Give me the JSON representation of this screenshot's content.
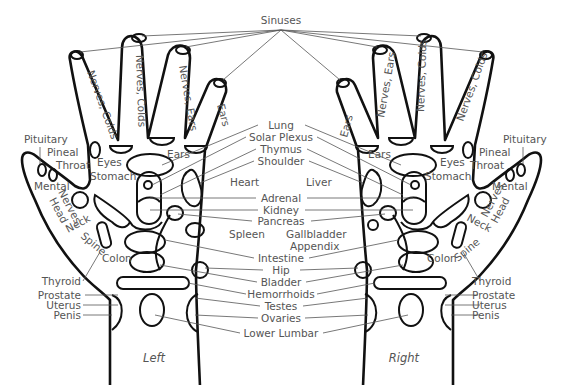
{
  "captions": {
    "left": "Left",
    "right": "Right"
  },
  "center_labels": {
    "top": "Sinuses",
    "upper": [
      "Lung",
      "Solar Plexus",
      "Thymus",
      "Shoulder"
    ],
    "middle": [
      "Adrenal",
      "Kidney",
      "Pancreas"
    ],
    "lower": [
      "Intestine",
      "Hip",
      "Bladder",
      "Hemorrhoids",
      "Testes",
      "Ovaries",
      "Lower Lumbar"
    ]
  },
  "left_hand": {
    "fingers": [
      "Nerves, Colds",
      "Nerves, Colds",
      "Nerves, Ears",
      "Ears"
    ],
    "labels": {
      "pituitary": "Pituitary",
      "pineal": "Pineal",
      "throat": "Throat",
      "mental": "Mental",
      "eyes": "Eyes",
      "stomach": "Stomach",
      "ears": "Ears",
      "nerves_head": [
        "Nerves,",
        "Head"
      ],
      "neck": "Neck",
      "spine": "Spine",
      "colon": "Colon",
      "heart": "Heart",
      "spleen": "Spleen",
      "thyroid": "Thyroid",
      "prostate": "Prostate",
      "uterus": "Uterus",
      "penis": "Penis"
    }
  },
  "right_hand": {
    "fingers": [
      "Ears",
      "Nerves, Ears",
      "Nerves, Colds",
      "Nerves, Colds"
    ],
    "labels": {
      "pituitary": "Pituitary",
      "pineal": "Pineal",
      "throat": "Throat",
      "mental": "Mental",
      "eyes": "Eyes",
      "stomach": "Stomach",
      "ears": "Ears",
      "nerves_head": [
        "Nerves,",
        "Head"
      ],
      "neck": "Neck",
      "spine": "Spine",
      "colon": "Colon",
      "liver": "Liver",
      "gallbladder": "Gallbladder",
      "appendix": "Appendix",
      "thyroid": "Thyroid",
      "prostate": "Prostate",
      "uterus": "Uterus",
      "penis": "Penis"
    }
  },
  "colors": {
    "outline": "#111111",
    "text": "#555555",
    "background": "#ffffff"
  }
}
